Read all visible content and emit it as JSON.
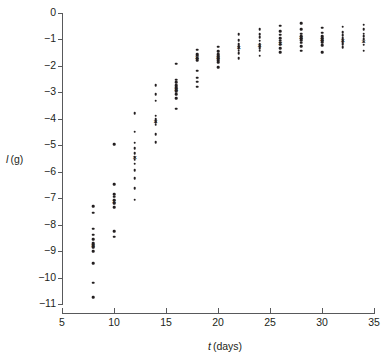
{
  "chart_data": {
    "type": "scatter",
    "title": "",
    "xlabel": "t (days)",
    "xlabel_parts": {
      "symbol": "t",
      "unit": "(days)"
    },
    "ylabel": "l (g)",
    "ylabel_parts": {
      "symbol": "l",
      "unit": "(g)"
    },
    "xlim": [
      5,
      35
    ],
    "ylim": [
      -11,
      0
    ],
    "xticks": [
      5,
      10,
      15,
      20,
      25,
      30,
      35
    ],
    "xticklabels": [
      "5",
      "10",
      "15",
      "20",
      "25",
      "30",
      "35"
    ],
    "yticks": [
      0,
      -1,
      -2,
      -3,
      -4,
      -5,
      -6,
      -7,
      -8,
      -9,
      -10,
      -11
    ],
    "yticklabels": [
      "0",
      "-1",
      "-2",
      "-3",
      "-4",
      "-5",
      "-6",
      "-7",
      "-8",
      "-9",
      "-10",
      "-11"
    ],
    "grid": false,
    "legend": null,
    "marker": "dot",
    "mean_marker": "x",
    "series": [
      {
        "name": "individual observations",
        "groups": [
          {
            "x": 8,
            "mean": -8.78,
            "values": [
              -7.3,
              -7.55,
              -8.15,
              -8.38,
              -8.55,
              -8.7,
              -8.78,
              -8.85,
              -9.0,
              -9.45,
              -10.2,
              -10.75
            ]
          },
          {
            "x": 10,
            "mean": -7.1,
            "values": [
              -4.95,
              -6.48,
              -6.85,
              -6.95,
              -7.05,
              -7.1,
              -7.2,
              -7.35,
              -8.25,
              -8.45
            ]
          },
          {
            "x": 12,
            "mean": -5.45,
            "values": [
              -3.78,
              -4.48,
              -4.9,
              -5.1,
              -5.3,
              -5.45,
              -5.55,
              -5.7,
              -5.95,
              -6.25,
              -6.62,
              -7.05
            ]
          },
          {
            "x": 14,
            "mean": -4.08,
            "values": [
              -2.72,
              -3.08,
              -3.32,
              -3.88,
              -4.0,
              -4.05,
              -4.12,
              -4.22,
              -4.58,
              -4.88
            ]
          },
          {
            "x": 16,
            "mean": -2.88,
            "values": [
              -1.92,
              -2.52,
              -2.62,
              -2.72,
              -2.8,
              -2.86,
              -2.92,
              -2.98,
              -3.08,
              -3.22,
              -3.62
            ]
          },
          {
            "x": 18,
            "mean": -1.66,
            "values": [
              -1.38,
              -1.55,
              -1.62,
              -1.7,
              -1.78,
              -2.18,
              -2.45,
              -2.6,
              -2.78
            ]
          },
          {
            "x": 20,
            "mean": -1.68,
            "values": [
              -1.28,
              -1.45,
              -1.55,
              -1.62,
              -1.68,
              -1.72,
              -1.78,
              -1.85,
              -2.05
            ]
          },
          {
            "x": 22,
            "mean": -1.3,
            "values": [
              -0.8,
              -1.02,
              -1.18,
              -1.25,
              -1.3,
              -1.35,
              -1.42,
              -1.52,
              -1.7
            ]
          },
          {
            "x": 24,
            "mean": -1.22,
            "values": [
              -0.62,
              -0.8,
              -0.92,
              -1.05,
              -1.18,
              -1.25,
              -1.32,
              -1.42,
              -1.62
            ]
          },
          {
            "x": 26,
            "mean": -1.12,
            "values": [
              -0.48,
              -0.68,
              -0.82,
              -0.95,
              -1.05,
              -1.12,
              -1.2,
              -1.32,
              -1.48
            ]
          },
          {
            "x": 28,
            "mean": -0.92,
            "values": [
              -0.38,
              -0.62,
              -0.78,
              -0.88,
              -0.95,
              -1.02,
              -1.12,
              -1.25,
              -1.42
            ]
          },
          {
            "x": 30,
            "mean": -0.98,
            "values": [
              -0.55,
              -0.75,
              -0.88,
              -0.95,
              -1.02,
              -1.1,
              -1.22,
              -1.48
            ]
          },
          {
            "x": 32,
            "mean": -1.02,
            "values": [
              -0.52,
              -0.72,
              -0.85,
              -0.95,
              -1.02,
              -1.1,
              -1.18,
              -1.3
            ]
          },
          {
            "x": 34,
            "mean": -1.05,
            "values": [
              -0.45,
              -0.62,
              -0.78,
              -0.88,
              -0.98,
              -1.08,
              -1.2,
              -1.42
            ]
          }
        ]
      }
    ]
  }
}
